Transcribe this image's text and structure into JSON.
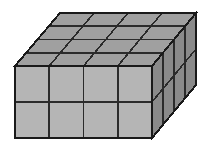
{
  "figure": {
    "name": "rectangular-prism-unit-cubes",
    "type": "3d-solid-diagram",
    "projection": "oblique",
    "dimensions": {
      "width_cubes": 4,
      "height_cubes": 2,
      "depth_cubes": 4,
      "total_cubes": 32
    },
    "faces": {
      "front": {
        "name": "front-face",
        "columns": 4,
        "rows": 2,
        "visible_cells": 8,
        "fill": "#b5b5b5"
      },
      "top": {
        "name": "top-face",
        "columns": 4,
        "rows": 4,
        "visible_cells": 16,
        "fill": "#a0a0a0"
      },
      "right": {
        "name": "right-face",
        "columns": 4,
        "rows": 2,
        "visible_cells": 8,
        "fill": "#8a8a8a"
      }
    },
    "stroke": {
      "outline_color": "#1a1a1a",
      "outline_width": 2,
      "grid_color": "#2b2b2b",
      "grid_width": 1.6
    },
    "background": "#ffffff",
    "geometry": {
      "front_top_left": [
        15,
        66
      ],
      "front_top_right": [
        152,
        66
      ],
      "front_bottom_left": [
        15,
        138
      ],
      "front_bottom_right": [
        152,
        138
      ],
      "back_top_left": [
        60,
        13
      ],
      "back_top_right": [
        196,
        13
      ],
      "back_bottom_right": [
        196,
        85
      ]
    },
    "labels": []
  }
}
